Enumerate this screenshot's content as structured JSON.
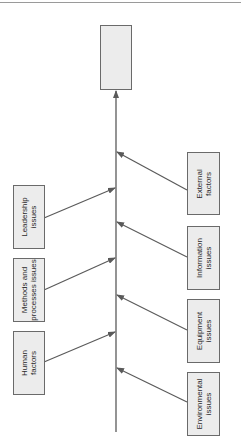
{
  "diagram": {
    "type": "fishbone",
    "effect": {
      "label": ""
    },
    "colors": {
      "line": "#5a5a5a",
      "box_fill": "#ececec",
      "box_border": "#6a6a6a",
      "text": "#2a2a2a"
    },
    "causes_left": [
      {
        "label": "Leadership\nissues"
      },
      {
        "label": "Methods and\nprocesses issues"
      },
      {
        "label": "Human\nfactors"
      }
    ],
    "causes_right": [
      {
        "label": "External\nfactors"
      },
      {
        "label": "Information\nissues"
      },
      {
        "label": "Equipment\nissues"
      },
      {
        "label": "Environmental\nissues"
      }
    ]
  }
}
